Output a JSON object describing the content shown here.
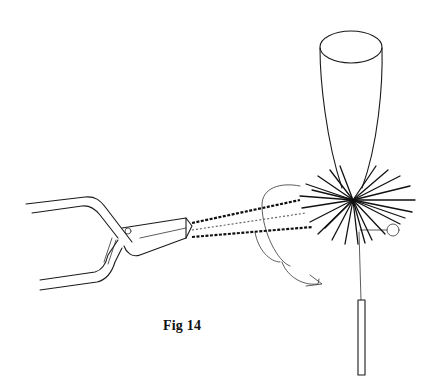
{
  "figure": {
    "caption": "Fig 14",
    "colors": {
      "ink": "#1a1a1a",
      "background": "#ffffff"
    },
    "parts": [
      "hackle-pliers",
      "thread-strands",
      "wing-post",
      "hackle-collar",
      "hook",
      "bobbin-needle"
    ]
  }
}
